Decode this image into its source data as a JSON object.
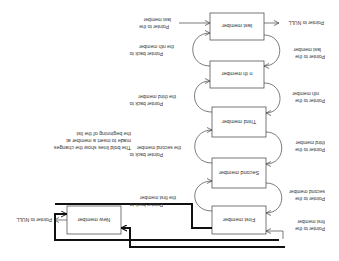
{
  "diagram": {
    "nodes": [
      {
        "id": "new",
        "label": "New member"
      },
      {
        "id": "first",
        "label": "First member"
      },
      {
        "id": "second",
        "label": "Second member"
      },
      {
        "id": "third",
        "label": "Third member"
      },
      {
        "id": "nth",
        "label": "n th member"
      },
      {
        "id": "last",
        "label": "last member"
      }
    ],
    "labels": {
      "new_null": "Pointer to NULL",
      "last_null": "Pointer to NULL",
      "ptr_first_l1": "Pointer to the",
      "ptr_first_l2": "first member",
      "ptr_second_l1": "Pointer to the",
      "ptr_second_l2": "second member",
      "ptr_third_l1": "Pointer to the",
      "ptr_third_l2": "third member",
      "ptr_nth_l1": "Pointer to the",
      "ptr_nth_l2": "nth member",
      "ptr_last_l1": "Pointer to the",
      "ptr_last_l2": "last member",
      "back_first_l1": "Pointer back to",
      "back_first_l2": "the first member",
      "back_second_l1": "Pointer back to",
      "back_second_l2": "the second member",
      "back_third_l1": "Pointer back to",
      "back_third_l2": "the third member",
      "back_nth_l1": "Pointer back to",
      "back_nth_l2": "the  nth member",
      "back_last_l1": "Pointer to the",
      "back_last_l2": "last member"
    },
    "note": [
      "The bold lines show the changes",
      "made to insert a member at",
      "the beginning of the list"
    ],
    "colors": {
      "bold_line": "#111111",
      "thin_line": "#444444",
      "box_border": "#555555"
    }
  }
}
